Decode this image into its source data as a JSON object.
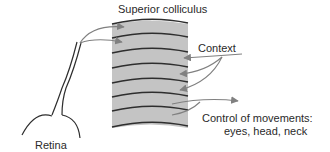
{
  "diagram": {
    "title_label": "Superior colliculus",
    "context_label": "Context",
    "control_label_line1": "Control of movements:",
    "control_label_line2": "eyes, head, neck",
    "retina_label": "Retina",
    "layer_count": 8,
    "colors": {
      "slab_fill": "#c4c4c4",
      "layer_line": "#2e2e2e",
      "arrow": "#808080",
      "text": "#2a2a2a"
    }
  }
}
